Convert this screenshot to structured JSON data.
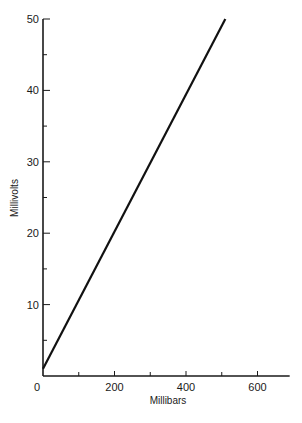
{
  "chart_data": {
    "type": "line",
    "title": "",
    "xlabel": "Millibars",
    "ylabel": "Millivolts",
    "xlim": [
      0,
      690
    ],
    "ylim": [
      0,
      50
    ],
    "x_ticks": [
      0,
      100,
      200,
      300,
      400,
      500,
      600
    ],
    "x_tick_labels": [
      "0",
      "",
      "200",
      "",
      "400",
      "",
      "600"
    ],
    "y_ticks": [
      0,
      5,
      10,
      15,
      20,
      25,
      30,
      35,
      40,
      45,
      50
    ],
    "y_tick_labels": [
      "",
      "",
      "10",
      "",
      "20",
      "",
      "30",
      "",
      "40",
      "",
      "50"
    ],
    "grid": false,
    "legend": null,
    "series": [
      {
        "name": "Output",
        "x": [
          0,
          510
        ],
        "y": [
          1,
          50
        ]
      }
    ]
  }
}
